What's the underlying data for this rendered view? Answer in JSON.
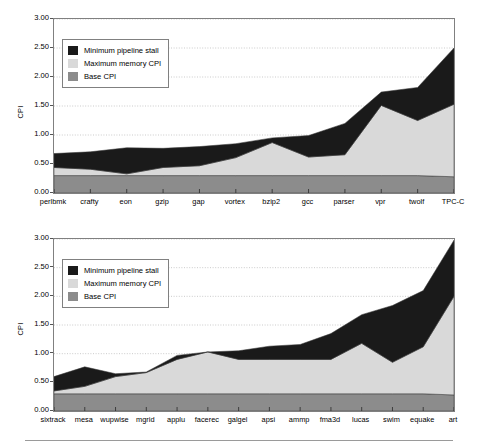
{
  "figure": {
    "legend": {
      "items": [
        {
          "label": "Minimum pipeline stall",
          "color": "#1a1a1a",
          "key": "pipeline_stall"
        },
        {
          "label": "Maximum memory CPI",
          "color": "#d9d9d9",
          "key": "memory_cpi"
        },
        {
          "label": "Base CPI",
          "color": "#8c8c8c",
          "key": "base_cpi"
        }
      ]
    }
  },
  "chart_data": [
    {
      "id": "top",
      "type": "area",
      "stacked": true,
      "title": "",
      "xlabel": "",
      "ylabel": "CPI",
      "ylim": [
        0,
        3.0
      ],
      "ytick_values": [
        0.0,
        0.5,
        1.0,
        1.5,
        2.0,
        2.5,
        3.0
      ],
      "ytick_labels": [
        "0.00",
        "0.50",
        "1.00",
        "1.50",
        "2.00",
        "2.50",
        "3.00"
      ],
      "grid": true,
      "grid_axis": "y",
      "legend_position": "upper-left-inside",
      "categories": [
        "perlbmk",
        "crafty",
        "eon",
        "gzip",
        "gap",
        "vortex",
        "bzip2",
        "gcc",
        "parser",
        "vpr",
        "twolf",
        "TPC-C"
      ],
      "series": [
        {
          "name": "Base CPI",
          "color": "#8c8c8c",
          "values": [
            0.3,
            0.3,
            0.3,
            0.3,
            0.3,
            0.3,
            0.3,
            0.3,
            0.3,
            0.3,
            0.3,
            0.28
          ]
        },
        {
          "name": "Maximum memory CPI",
          "color": "#d9d9d9",
          "values": [
            0.14,
            0.11,
            0.03,
            0.14,
            0.17,
            0.31,
            0.57,
            0.32,
            0.36,
            1.21,
            0.95,
            1.25
          ]
        },
        {
          "name": "Minimum pipeline stall",
          "color": "#1a1a1a",
          "values": [
            0.24,
            0.3,
            0.45,
            0.33,
            0.33,
            0.24,
            0.08,
            0.37,
            0.54,
            0.23,
            0.57,
            0.97
          ]
        }
      ],
      "cumulative_totals": [
        0.68,
        0.71,
        0.78,
        0.77,
        0.8,
        0.85,
        0.95,
        0.99,
        1.2,
        1.74,
        1.82,
        2.5
      ]
    },
    {
      "id": "bottom",
      "type": "area",
      "stacked": true,
      "title": "",
      "xlabel": "",
      "ylabel": "CPI",
      "ylim": [
        0,
        3.0
      ],
      "ytick_values": [
        0.0,
        0.5,
        1.0,
        1.5,
        2.0,
        2.5,
        3.0
      ],
      "ytick_labels": [
        "0.00",
        "0.50",
        "1.00",
        "1.50",
        "2.00",
        "2.50",
        "3.00"
      ],
      "grid": true,
      "grid_axis": "y",
      "legend_position": "upper-left-inside",
      "categories": [
        "sixtrack",
        "mesa",
        "wupwise",
        "mgrid",
        "applu",
        "facerec",
        "galgel",
        "apsi",
        "ammp",
        "fma3d",
        "lucas",
        "swim",
        "equake",
        "art"
      ],
      "series": [
        {
          "name": "Base CPI",
          "color": "#8c8c8c",
          "values": [
            0.3,
            0.3,
            0.3,
            0.3,
            0.3,
            0.3,
            0.3,
            0.3,
            0.3,
            0.3,
            0.3,
            0.3,
            0.3,
            0.28
          ]
        },
        {
          "name": "Maximum memory CPI",
          "color": "#d9d9d9",
          "values": [
            0.05,
            0.13,
            0.3,
            0.37,
            0.6,
            0.73,
            0.6,
            0.6,
            0.6,
            0.6,
            0.88,
            0.55,
            0.82,
            1.72
          ]
        },
        {
          "name": "Minimum pipeline stall",
          "color": "#1a1a1a",
          "values": [
            0.25,
            0.34,
            0.05,
            0.01,
            0.07,
            0.0,
            0.15,
            0.23,
            0.26,
            0.45,
            0.5,
            0.99,
            0.98,
            0.98
          ]
        }
      ],
      "cumulative_totals": [
        0.6,
        0.77,
        0.65,
        0.68,
        0.97,
        1.03,
        1.05,
        1.13,
        1.16,
        1.35,
        1.68,
        1.84,
        2.1,
        2.98
      ]
    }
  ]
}
